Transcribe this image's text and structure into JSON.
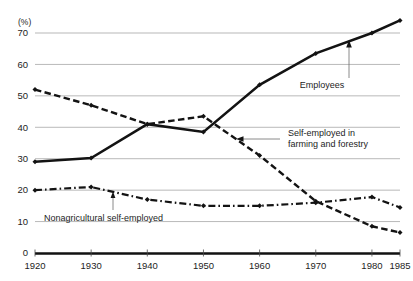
{
  "chart_data": {
    "type": "line",
    "title": "",
    "xlabel": "",
    "ylabel": "(%)",
    "y_unit_label": "(%)",
    "x": [
      1920,
      1930,
      1940,
      1950,
      1960,
      1970,
      1980,
      1985
    ],
    "categories": [
      "1920",
      "1930",
      "1940",
      "1950",
      "1960",
      "1970",
      "1980",
      "1985"
    ],
    "xtick_labels": [
      "1920",
      "1930",
      "1940",
      "1950",
      "1960",
      "1970",
      "1980",
      "1985"
    ],
    "ytick_labels": [
      "0",
      "10",
      "20",
      "30",
      "40",
      "50",
      "60",
      "70"
    ],
    "ytick_values": [
      0,
      10,
      20,
      30,
      40,
      50,
      60,
      70
    ],
    "xlim": [
      1920,
      1985
    ],
    "ylim": [
      0,
      76
    ],
    "grid": "horizontal",
    "legend": "inline-annotations",
    "series": [
      {
        "name": "Employees",
        "style": "solid",
        "values": [
          29,
          30.2,
          41,
          38.5,
          53.5,
          63.5,
          70,
          74
        ]
      },
      {
        "name": "Self-employed in farming and forestry",
        "style": "dashed",
        "values": [
          52,
          47,
          41,
          43.5,
          31,
          16.5,
          8.5,
          6.5
        ]
      },
      {
        "name": "Nonagricultural self-employed",
        "style": "dash-dot",
        "values": [
          20,
          21,
          17,
          15,
          15,
          16,
          17.8,
          14.5
        ]
      }
    ],
    "annotations": [
      {
        "id": "employees",
        "lines": [
          "Employees"
        ],
        "target_series": "Employees",
        "arrow": "up"
      },
      {
        "id": "farming",
        "lines": [
          "Self-employed in",
          "farming and forestry"
        ],
        "target_series": "Self-employed in farming and forestry",
        "arrow": "left"
      },
      {
        "id": "nonagricultural",
        "lines": [
          "Nonagricultural self-employed"
        ],
        "target_series": "Nonagricultural self-employed",
        "arrow": "up"
      }
    ],
    "colors": {
      "line": "#131313",
      "grid": "#9a9a9a",
      "axis": "#111111",
      "text": "#1d1d1d",
      "leader": "#6d6d6d",
      "background": "#ffffff"
    }
  }
}
